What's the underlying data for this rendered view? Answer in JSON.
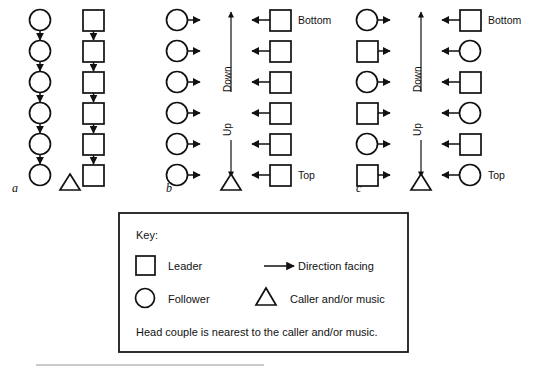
{
  "figure": {
    "title_label": "",
    "panels": [
      {
        "id": "a",
        "label": "a",
        "left_column": [
          "follower",
          "follower",
          "follower",
          "follower",
          "follower",
          "follower"
        ],
        "right_column": [
          "leader",
          "leader",
          "leader",
          "leader",
          "leader",
          "leader"
        ],
        "left_connector": "down-arrow",
        "right_connector": "down-arrow",
        "caller": "triangle",
        "row_labels": {
          "top": "",
          "bottom": ""
        },
        "center_arrows": []
      },
      {
        "id": "b",
        "label": "b",
        "left_column": [
          "follower",
          "follower",
          "follower",
          "follower",
          "follower",
          "follower"
        ],
        "right_column": [
          "leader",
          "leader",
          "leader",
          "leader",
          "leader",
          "leader"
        ],
        "left_facing": "right",
        "right_facing": "left",
        "caller": "triangle",
        "row_labels": {
          "top": "Bottom",
          "bottom": "Top"
        },
        "center_arrows": [
          {
            "name": "Down",
            "direction": "up"
          },
          {
            "name": "Up",
            "direction": "down"
          }
        ]
      },
      {
        "id": "c",
        "label": "c",
        "left_column": [
          "follower",
          "leader",
          "follower",
          "leader",
          "follower",
          "leader"
        ],
        "right_column": [
          "leader",
          "follower",
          "leader",
          "follower",
          "leader",
          "follower"
        ],
        "left_facing": "right",
        "right_facing": "left",
        "caller": "triangle",
        "row_labels": {
          "top": "Bottom",
          "bottom": "Top"
        },
        "center_arrows": [
          {
            "name": "Down",
            "direction": "up"
          },
          {
            "name": "Up",
            "direction": "down"
          }
        ]
      }
    ]
  },
  "key": {
    "heading": "Key:",
    "entries": [
      {
        "symbol": "square",
        "label": "Leader"
      },
      {
        "symbol": "arrow",
        "label": "Direction facing"
      },
      {
        "symbol": "circle",
        "label": "Follower"
      },
      {
        "symbol": "triangle",
        "label": "Caller and/or music"
      }
    ],
    "note": "Head couple is nearest to the caller and/or music."
  },
  "colors": {
    "ink": "#111111",
    "paper": "#ffffff",
    "scan_artifact": "#b8b8b8"
  }
}
